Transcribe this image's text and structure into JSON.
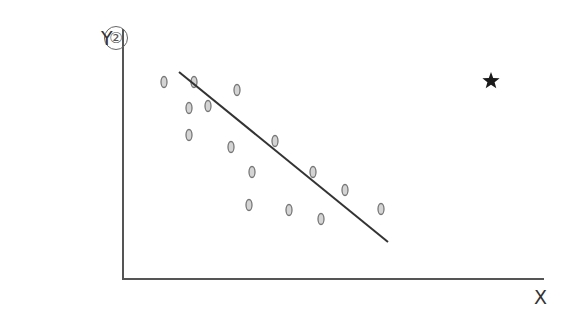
{
  "figure": {
    "label": "②",
    "y_axis_label": "Y",
    "x_axis_label": "X"
  },
  "chart_data": {
    "type": "scatter",
    "title": "",
    "xlabel": "X",
    "ylabel": "Y",
    "grid": false,
    "ticks": "none",
    "legend": "none",
    "note": "Coordinates in pixel space of the figure (origin at axes corner, y increasing upward).",
    "points": [
      {
        "x": 41,
        "y": 197
      },
      {
        "x": 71,
        "y": 197
      },
      {
        "x": 66,
        "y": 171
      },
      {
        "x": 85,
        "y": 173
      },
      {
        "x": 114,
        "y": 189
      },
      {
        "x": 66,
        "y": 144
      },
      {
        "x": 108,
        "y": 132
      },
      {
        "x": 152,
        "y": 138
      },
      {
        "x": 129,
        "y": 107
      },
      {
        "x": 190,
        "y": 107
      },
      {
        "x": 126,
        "y": 74
      },
      {
        "x": 222,
        "y": 89
      },
      {
        "x": 166,
        "y": 69
      },
      {
        "x": 198,
        "y": 60
      },
      {
        "x": 258,
        "y": 70
      }
    ],
    "trend_line": {
      "from": {
        "x": 56,
        "y": 207
      },
      "to": {
        "x": 265,
        "y": 37
      },
      "direction": "negative"
    },
    "outlier": {
      "marker": "star",
      "x": 368,
      "y": 198
    }
  }
}
